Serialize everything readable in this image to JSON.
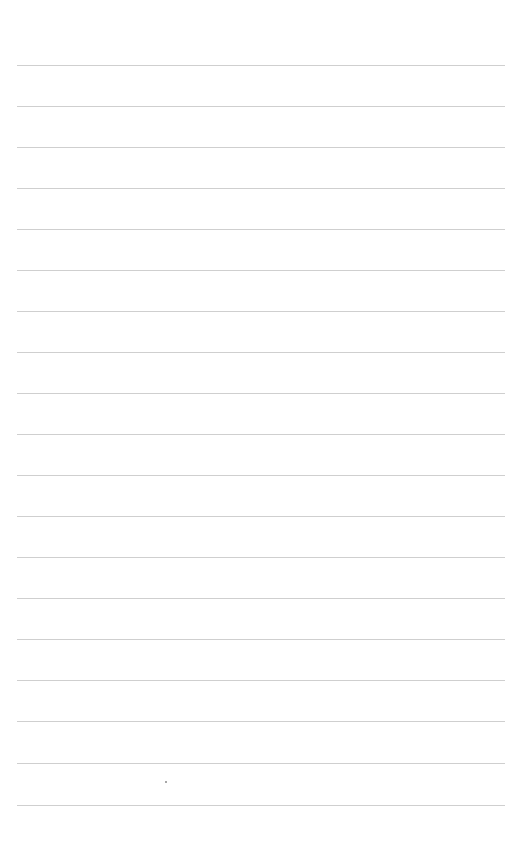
{
  "document": {
    "type": "lined-paper",
    "background_color": "#ffffff",
    "rule_color": "#cfcfcf",
    "rule_count": 19,
    "text": ""
  },
  "rules": [
    {
      "y": 65
    },
    {
      "y": 106
    },
    {
      "y": 147
    },
    {
      "y": 188
    },
    {
      "y": 229
    },
    {
      "y": 270
    },
    {
      "y": 311
    },
    {
      "y": 352
    },
    {
      "y": 393
    },
    {
      "y": 434
    },
    {
      "y": 475
    },
    {
      "y": 516
    },
    {
      "y": 557
    },
    {
      "y": 598
    },
    {
      "y": 639
    },
    {
      "y": 680
    },
    {
      "y": 721
    },
    {
      "y": 763
    },
    {
      "y": 805
    }
  ],
  "marks": [
    {
      "x": 165,
      "y": 781
    }
  ]
}
